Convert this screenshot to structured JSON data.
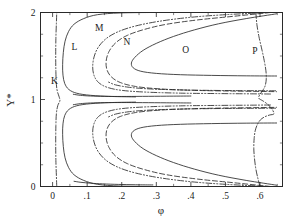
{
  "chart_data": {
    "type": "line",
    "title": "",
    "xlabel": "φ",
    "ylabel": "Y*",
    "xlim": [
      -0.035,
      0.665
    ],
    "ylim": [
      0,
      2
    ],
    "grid": false,
    "legend_position": "inline-labels",
    "xticks": [
      0,
      0.1,
      0.2,
      0.3,
      0.4,
      0.5,
      0.6
    ],
    "xticklabels": [
      "0",
      ".1",
      ".2",
      ".3",
      ".4",
      ".5",
      ".6"
    ],
    "xtick_minor_step": 0.05,
    "yticks": [
      0,
      1,
      2
    ],
    "yticklabels": [
      "0",
      "1",
      "2"
    ],
    "ytick_minor_step": 0.25,
    "annotations": [
      {
        "text": "K",
        "x": 0.005,
        "y": 1.18
      },
      {
        "text": "M",
        "x": 0.135,
        "y": 1.79
      },
      {
        "text": "L",
        "x": 0.063,
        "y": 1.565
      },
      {
        "text": "N",
        "x": 0.215,
        "y": 1.63
      },
      {
        "text": "O",
        "x": 0.385,
        "y": 1.53
      },
      {
        "text": "P",
        "x": 0.585,
        "y": 1.525
      }
    ],
    "series": [
      {
        "name": "K",
        "label": "K",
        "style": "dashdot",
        "color": "#2b2b2b",
        "description": "Near-vertical curve at phi ~ 0.01 spanning full Y* range, pinching toward phi ~ 0.02 at Y* = 1",
        "points": [
          [
            0.012,
            0.0
          ],
          [
            0.011,
            0.12
          ],
          [
            0.0095,
            0.3
          ],
          [
            0.009,
            0.5
          ],
          [
            0.0095,
            0.7
          ],
          [
            0.011,
            0.84
          ],
          [
            0.015,
            0.93
          ],
          [
            0.021,
            0.985
          ],
          [
            0.019,
            1.03
          ],
          [
            0.014,
            1.09
          ],
          [
            0.011,
            1.17
          ],
          [
            0.0095,
            1.32
          ],
          [
            0.009,
            1.5
          ],
          [
            0.0095,
            1.7
          ],
          [
            0.011,
            1.88
          ],
          [
            0.012,
            2.0
          ]
        ]
      },
      {
        "name": "L",
        "label": "L",
        "style": "solid",
        "color": "#2b2b2b",
        "description": "Rounded loop closing near Y*=1 and Y*=0, nose near phi 0.29",
        "points_upper": [
          [
            0.285,
            2.0
          ],
          [
            0.195,
            1.995
          ],
          [
            0.13,
            1.975
          ],
          [
            0.09,
            1.93
          ],
          [
            0.062,
            1.865
          ],
          [
            0.046,
            1.78
          ],
          [
            0.036,
            1.67
          ],
          [
            0.031,
            1.54
          ],
          [
            0.029,
            1.4
          ],
          [
            0.03,
            1.28
          ],
          [
            0.035,
            1.185
          ],
          [
            0.047,
            1.115
          ],
          [
            0.07,
            1.072
          ],
          [
            0.11,
            1.048
          ],
          [
            0.17,
            1.035
          ],
          [
            0.24,
            1.03
          ]
        ],
        "points_lower": [
          [
            0.285,
            0.0
          ],
          [
            0.195,
            0.005
          ],
          [
            0.13,
            0.025
          ],
          [
            0.09,
            0.07
          ],
          [
            0.062,
            0.135
          ],
          [
            0.046,
            0.22
          ],
          [
            0.036,
            0.33
          ],
          [
            0.031,
            0.46
          ],
          [
            0.029,
            0.6
          ],
          [
            0.03,
            0.72
          ],
          [
            0.035,
            0.815
          ],
          [
            0.047,
            0.885
          ],
          [
            0.07,
            0.928
          ],
          [
            0.11,
            0.952
          ],
          [
            0.17,
            0.965
          ],
          [
            0.24,
            0.97
          ]
        ]
      },
      {
        "name": "M",
        "label": "M",
        "style": "dashdotdot",
        "color": "#2b2b2b",
        "description": "Dash-dot-dot contour nested outside N, reaching right boundary near phi 0.62",
        "points_upper": [
          [
            0.625,
            2.0
          ],
          [
            0.5,
            1.975
          ],
          [
            0.4,
            1.945
          ],
          [
            0.31,
            1.9
          ],
          [
            0.24,
            1.845
          ],
          [
            0.19,
            1.78
          ],
          [
            0.155,
            1.7
          ],
          [
            0.132,
            1.6
          ],
          [
            0.12,
            1.49
          ],
          [
            0.116,
            1.375
          ],
          [
            0.12,
            1.275
          ],
          [
            0.133,
            1.195
          ],
          [
            0.158,
            1.14
          ],
          [
            0.2,
            1.105
          ],
          [
            0.27,
            1.085
          ],
          [
            0.37,
            1.073
          ],
          [
            0.48,
            1.068
          ],
          [
            0.58,
            1.065
          ],
          [
            0.63,
            1.063
          ]
        ],
        "points_lower": [
          [
            0.625,
            0.0
          ],
          [
            0.5,
            0.025
          ],
          [
            0.4,
            0.055
          ],
          [
            0.31,
            0.1
          ],
          [
            0.24,
            0.155
          ],
          [
            0.19,
            0.22
          ],
          [
            0.155,
            0.3
          ],
          [
            0.132,
            0.4
          ],
          [
            0.12,
            0.51
          ],
          [
            0.116,
            0.625
          ],
          [
            0.12,
            0.725
          ],
          [
            0.133,
            0.805
          ],
          [
            0.158,
            0.86
          ],
          [
            0.2,
            0.895
          ],
          [
            0.27,
            0.915
          ],
          [
            0.37,
            0.927
          ],
          [
            0.48,
            0.932
          ],
          [
            0.58,
            0.935
          ],
          [
            0.63,
            0.937
          ]
        ]
      },
      {
        "name": "N",
        "label": "N",
        "style": "dashed",
        "color": "#2b2b2b",
        "description": "Dashed contour nested inside M, nose near phi 0.155 at Y* ~ 1.4",
        "points_upper": [
          [
            0.63,
            2.0
          ],
          [
            0.52,
            1.955
          ],
          [
            0.42,
            1.915
          ],
          [
            0.33,
            1.865
          ],
          [
            0.265,
            1.805
          ],
          [
            0.215,
            1.735
          ],
          [
            0.182,
            1.65
          ],
          [
            0.163,
            1.55
          ],
          [
            0.155,
            1.445
          ],
          [
            0.157,
            1.345
          ],
          [
            0.17,
            1.26
          ],
          [
            0.196,
            1.195
          ],
          [
            0.24,
            1.15
          ],
          [
            0.31,
            1.122
          ],
          [
            0.41,
            1.105
          ],
          [
            0.52,
            1.097
          ],
          [
            0.62,
            1.092
          ],
          [
            0.648,
            1.09
          ]
        ],
        "points_lower": [
          [
            0.63,
            0.0
          ],
          [
            0.52,
            0.045
          ],
          [
            0.42,
            0.085
          ],
          [
            0.33,
            0.135
          ],
          [
            0.265,
            0.195
          ],
          [
            0.215,
            0.265
          ],
          [
            0.182,
            0.35
          ],
          [
            0.163,
            0.45
          ],
          [
            0.155,
            0.555
          ],
          [
            0.157,
            0.655
          ],
          [
            0.17,
            0.74
          ],
          [
            0.196,
            0.805
          ],
          [
            0.24,
            0.85
          ],
          [
            0.31,
            0.878
          ],
          [
            0.41,
            0.895
          ],
          [
            0.52,
            0.903
          ],
          [
            0.62,
            0.908
          ],
          [
            0.648,
            0.91
          ]
        ]
      },
      {
        "name": "O",
        "label": "O",
        "style": "solid",
        "color": "#2b2b2b",
        "description": "Solid contour with sharp nose near phi 0.23 at Y* ~ 1.38, opening to the right boundary",
        "points_upper": [
          [
            0.648,
            1.985
          ],
          [
            0.56,
            1.93
          ],
          [
            0.48,
            1.87
          ],
          [
            0.41,
            1.8
          ],
          [
            0.35,
            1.725
          ],
          [
            0.3,
            1.645
          ],
          [
            0.262,
            1.565
          ],
          [
            0.238,
            1.485
          ],
          [
            0.228,
            1.42
          ],
          [
            0.233,
            1.365
          ],
          [
            0.255,
            1.325
          ],
          [
            0.3,
            1.3
          ],
          [
            0.37,
            1.285
          ],
          [
            0.46,
            1.277
          ],
          [
            0.56,
            1.272
          ],
          [
            0.648,
            1.27
          ]
        ],
        "points_lower": [
          [
            0.648,
            0.015
          ],
          [
            0.56,
            0.07
          ],
          [
            0.48,
            0.13
          ],
          [
            0.41,
            0.2
          ],
          [
            0.35,
            0.275
          ],
          [
            0.3,
            0.355
          ],
          [
            0.262,
            0.435
          ],
          [
            0.238,
            0.515
          ],
          [
            0.228,
            0.58
          ],
          [
            0.233,
            0.635
          ],
          [
            0.255,
            0.675
          ],
          [
            0.3,
            0.7
          ],
          [
            0.37,
            0.715
          ],
          [
            0.46,
            0.723
          ],
          [
            0.56,
            0.728
          ],
          [
            0.648,
            0.73
          ]
        ]
      },
      {
        "name": "P",
        "label": "P",
        "style": "dashdot",
        "color": "#2b2b2b",
        "description": "Dash-dot curve near the right boundary rising steeply from phi ~ 0.575 with a kink near Y* = 1",
        "points": [
          [
            0.6,
            0.0
          ],
          [
            0.594,
            0.09
          ],
          [
            0.588,
            0.2
          ],
          [
            0.584,
            0.32
          ],
          [
            0.582,
            0.44
          ],
          [
            0.583,
            0.55
          ],
          [
            0.586,
            0.64
          ],
          [
            0.592,
            0.71
          ],
          [
            0.601,
            0.765
          ],
          [
            0.613,
            0.8
          ],
          [
            0.628,
            0.822
          ],
          [
            0.64,
            0.835
          ],
          [
            0.634,
            0.895
          ],
          [
            0.622,
            0.945
          ],
          [
            0.608,
            0.985
          ],
          [
            0.596,
            1.015
          ],
          [
            0.6,
            1.06
          ],
          [
            0.608,
            1.105
          ],
          [
            0.615,
            1.16
          ],
          [
            0.618,
            1.235
          ],
          [
            0.617,
            1.33
          ],
          [
            0.612,
            1.45
          ],
          [
            0.605,
            1.58
          ],
          [
            0.597,
            1.72
          ],
          [
            0.591,
            1.86
          ],
          [
            0.588,
            2.0
          ]
        ]
      }
    ],
    "inner_contours": [
      {
        "name": "inner-dashdot-upper",
        "style": "dashdot",
        "points": [
          [
            0.645,
            1.1
          ],
          [
            0.54,
            1.102
          ],
          [
            0.43,
            1.106
          ],
          [
            0.34,
            1.113
          ],
          [
            0.27,
            1.124
          ],
          [
            0.218,
            1.142
          ],
          [
            0.182,
            1.168
          ],
          [
            0.162,
            1.2
          ]
        ]
      },
      {
        "name": "inner-dashdot-lower",
        "style": "dashdot",
        "points": [
          [
            0.645,
            0.9
          ],
          [
            0.54,
            0.898
          ],
          [
            0.43,
            0.894
          ],
          [
            0.34,
            0.887
          ],
          [
            0.27,
            0.876
          ],
          [
            0.218,
            0.858
          ],
          [
            0.182,
            0.832
          ],
          [
            0.162,
            0.8
          ]
        ]
      },
      {
        "name": "inner-solid-upper",
        "style": "solid",
        "points": [
          [
            0.4,
            1.04
          ],
          [
            0.33,
            1.038
          ],
          [
            0.26,
            1.036
          ],
          [
            0.2,
            1.035
          ],
          [
            0.15,
            1.036
          ],
          [
            0.11,
            1.04
          ],
          [
            0.08,
            1.048
          ],
          [
            0.06,
            1.06
          ]
        ]
      },
      {
        "name": "inner-solid-lower",
        "style": "solid",
        "points": [
          [
            0.4,
            0.96
          ],
          [
            0.33,
            0.962
          ],
          [
            0.26,
            0.964
          ],
          [
            0.2,
            0.965
          ],
          [
            0.15,
            0.964
          ],
          [
            0.11,
            0.96
          ],
          [
            0.08,
            0.952
          ],
          [
            0.06,
            0.94
          ]
        ]
      },
      {
        "name": "baseline-solid-lower",
        "style": "solid",
        "points": [
          [
            0.29,
            0.018
          ],
          [
            0.24,
            0.02
          ],
          [
            0.19,
            0.024
          ],
          [
            0.145,
            0.03
          ],
          [
            0.11,
            0.038
          ],
          [
            0.082,
            0.048
          ],
          [
            0.062,
            0.06
          ]
        ]
      }
    ]
  },
  "figure": {
    "background": "#ffffff",
    "line_color": "#2b2b2b",
    "frame_color": "#2a2a2a"
  }
}
